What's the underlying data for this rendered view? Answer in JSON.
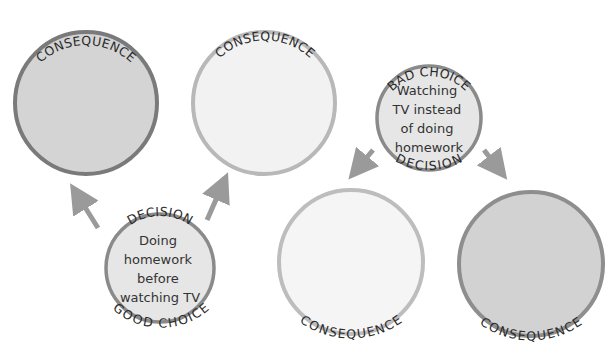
{
  "diagram": {
    "good_path": {
      "decision": {
        "top_label": "DECISION",
        "bottom_label": "GOOD CHOICE",
        "text_lines": [
          "Doing",
          "homework",
          "before",
          "watching TV"
        ]
      },
      "consequence_left": {
        "label": "CONSEQUENCE"
      },
      "consequence_right": {
        "label": "CONSEQUENCE"
      }
    },
    "bad_path": {
      "decision": {
        "top_label": "BAD CHOICE",
        "bottom_label": "DECISION",
        "text_lines": [
          "Watching",
          "TV instead",
          "of doing",
          "homework"
        ]
      },
      "consequence_left": {
        "label": "CONSEQUENCE"
      },
      "consequence_right": {
        "label": "CONSEQUENCE"
      }
    },
    "colors": {
      "dark_border": "#7a7a7a",
      "dark_fill": "#d4d4d4",
      "light_border": "#b8b8b8",
      "light_fill": "#f2f2f2",
      "decision_fill": "#e6e6e6",
      "arrow": "#9a9a9a"
    }
  }
}
